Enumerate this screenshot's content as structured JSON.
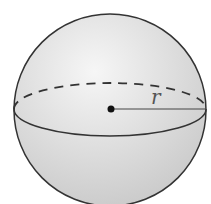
{
  "diagram": {
    "type": "sphere",
    "label_radius": "r",
    "colors": {
      "outline": "#333333",
      "fill_light": "#f4f4f4",
      "fill_dark": "#c8c8c8",
      "label": "#555555"
    }
  }
}
